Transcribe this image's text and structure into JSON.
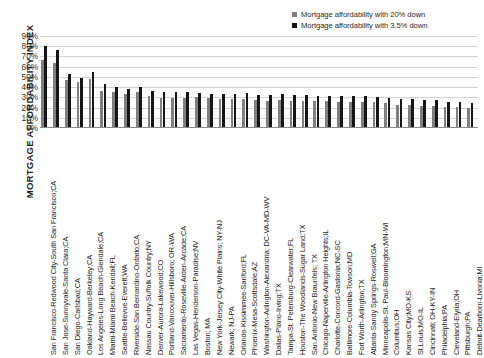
{
  "chart_data": {
    "type": "bar",
    "title": "",
    "xlabel": "",
    "ylabel": "MORTGAGE AFFORDABILITY INDEX",
    "ylim": [
      0,
      90
    ],
    "ytick_labels": [
      "90%",
      "80%",
      "70%",
      "60%",
      "50%",
      "40%",
      "30%",
      "20%",
      "10%",
      "0%"
    ],
    "ytick_values": [
      90,
      80,
      70,
      60,
      50,
      40,
      30,
      20,
      10,
      0
    ],
    "grid": true,
    "legend_position": "top-right",
    "categories": [
      "San Francisco-Redwood City-South San Francisco;CA",
      "San Jose-Sunnyvale-Santa Clara;CA",
      "San Diego-Carlsbad;CA",
      "Oakland-Hayward-Berkeley;CA",
      "Los Angeles-Long Beach-Glendale;CA",
      "Miami-Miami Beach-Kendall;FL",
      "Seattle-Bellevue-Everett;WA",
      "Riverside-San Bernardino-Ontario;CA",
      "Nassau Country-Suffolk Country;NY",
      "Denver-Aurora-Lakewood;CO",
      "Portland-Vancouver-Hillsboro; OR-WA",
      "Sacramento-Roseville-Arden-Arcade;CA",
      "Las Vegas-Henderson-Paradise;NV",
      "Boston; MA",
      "New York-Jersey City-White Plains; NY-NJ",
      "Newark; NJ-PA",
      "Orlando-Kissimmee-Sanford;FL",
      "Phoenix-Mesa-Scottsdale;AZ",
      "Washington-Arlington-Alexandria; DC-VA-MD-WV",
      "Dallas-Plano-Irving;TX",
      "Tampa-St. Petersburg-Clearwater;FL",
      "Houston-The Woodlands-Sugar Land;TX",
      "San Antonio-New Braunfels; TX",
      "Chicago-Naperville-Arlington Heights;IL",
      "Charlotte-Concord-Gastonia;NC-SC",
      "Baltimore-Columbia-Towson;MD",
      "Fort Worth-Arlington;TX",
      "Atlanta-Sandy Springs-Roswell;GA",
      "Minneapolis-St. Paul-Bloomington;MN-WI",
      "Columbus;OH",
      "Kansas City;MO-KS",
      "St.Louis;MO-IL",
      "Cincinnati; OH-KY-IN",
      "Philadelphia;PA",
      "Cleveland-Elyria;OH",
      "Pittsburgh;PA",
      "Detroit-Dearborn-Livonia;MI"
    ],
    "series": [
      {
        "name": "Mortgage affordability with 20% down",
        "color": "#808080",
        "values": [
          67,
          64,
          47,
          45,
          48,
          36,
          35,
          33,
          35,
          31,
          29,
          29,
          29,
          30,
          29,
          28,
          28,
          28,
          27,
          26,
          27,
          26,
          26,
          26,
          26,
          25,
          25,
          25,
          25,
          24,
          23,
          23,
          22,
          22,
          21,
          21,
          20
        ]
      },
      {
        "name": "Mortgage affordability with 3.5% down",
        "color": "#161616",
        "values": [
          80,
          76,
          53,
          49,
          55,
          43,
          40,
          38,
          40,
          36,
          35,
          35,
          35,
          34,
          33,
          33,
          33,
          34,
          32,
          32,
          33,
          32,
          32,
          31,
          31,
          31,
          31,
          31,
          30,
          29,
          28,
          28,
          27,
          27,
          25,
          25,
          24
        ]
      }
    ]
  },
  "legend": {
    "items": [
      {
        "label": "Mortgage affordability with 20% down",
        "color": "#808080"
      },
      {
        "label": "Mortgage affordability with 3.5% down",
        "color": "#161616"
      }
    ]
  },
  "axis": {
    "y_title": "MORTGAGE AFFORDABILITY INDEX"
  }
}
